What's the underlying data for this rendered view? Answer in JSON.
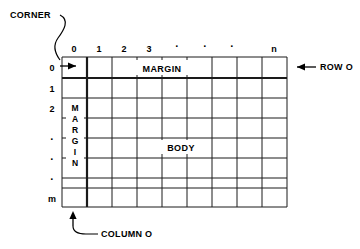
{
  "figure": {
    "type": "grid-diagram"
  },
  "grid": {
    "columns": 9,
    "rows": 8,
    "column_headers": [
      "0",
      "1",
      "2",
      "3",
      "·",
      "·",
      "·",
      "",
      "n"
    ],
    "row_headers": [
      "0",
      "1",
      "2",
      "·",
      "·",
      "·",
      "",
      "m"
    ],
    "bold_separator_after_row": 0,
    "bold_separator_after_column": 0
  },
  "regions": {
    "margin_top": "MARGIN",
    "margin_left_letters": [
      "M",
      "A",
      "R",
      "G",
      "I",
      "N"
    ],
    "margin_left": "MARGIN",
    "body": "BODY"
  },
  "callouts": {
    "corner": "CORNER",
    "row_zero": "ROW  O",
    "column_zero": "COLUMN  O"
  },
  "colors": {
    "ink": "#000000",
    "background": "#ffffff",
    "rule": "#1a1a1a"
  }
}
